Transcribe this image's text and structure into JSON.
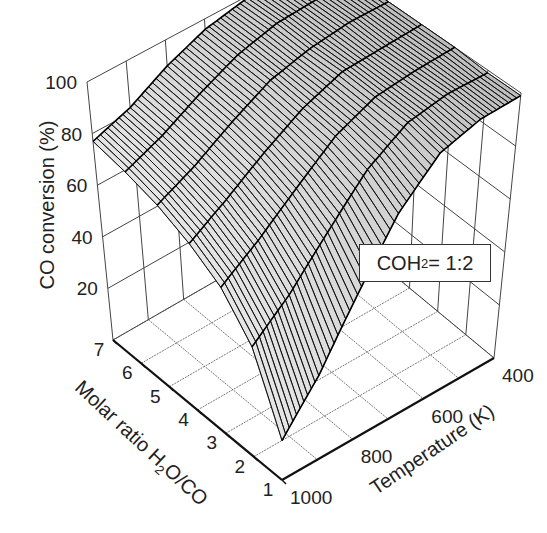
{
  "chart_data": {
    "type": "surface3d",
    "title": "",
    "annotation": "COH2 = 1:2",
    "annotation_parts": {
      "pre": "COH",
      "sub": "2",
      "post": " = 1:2"
    },
    "xlabel": "Temperature (K)",
    "ylabel": "Molar ratio H2O/CO",
    "ylabel_parts": {
      "pre": "Molar ratio H",
      "sub": "2",
      "post": "O/CO"
    },
    "zlabel": "CO conversion (%)",
    "x_ticks": [
      400,
      600,
      800,
      1000
    ],
    "y_ticks": [
      1,
      2,
      3,
      4,
      5,
      6,
      7
    ],
    "z_ticks": [
      20,
      40,
      60,
      80,
      100
    ],
    "xlim": [
      400,
      1000
    ],
    "ylim": [
      1,
      7
    ],
    "zlim": [
      0,
      100
    ],
    "x": [
      400,
      500,
      600,
      700,
      800,
      900,
      1000
    ],
    "y": [
      1,
      2,
      3,
      4,
      5,
      6,
      7
    ],
    "z_by_temperature_rows_h2o_cols": [
      [
        99,
        99,
        100,
        100,
        100,
        100,
        100
      ],
      [
        98,
        99,
        99,
        99,
        100,
        100,
        100
      ],
      [
        93,
        96,
        97,
        98,
        98,
        99,
        99
      ],
      [
        78,
        86,
        90,
        92,
        94,
        95,
        96
      ],
      [
        55,
        70,
        78,
        83,
        86,
        88,
        90
      ],
      [
        32,
        54,
        66,
        73,
        77,
        80,
        82
      ],
      [
        15,
        42,
        56,
        64,
        70,
        74,
        77
      ]
    ],
    "grid": true,
    "legend_position": "inside-right"
  }
}
